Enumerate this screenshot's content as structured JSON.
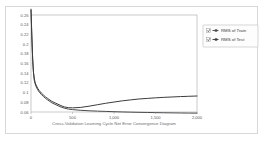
{
  "panel": {
    "background_color": "#ffffff",
    "border_color": "#d8d8d8"
  },
  "chart_data": {
    "type": "line",
    "title": "",
    "xlabel": "Cross-Validation Learning Cycle Net Error Convergence Diagram",
    "ylabel": "",
    "xlim": [
      0,
      2000
    ],
    "ylim": [
      0.06,
      0.26
    ],
    "grid": false,
    "legend_position": "right-outside",
    "x_tick_labels": [
      "0",
      "500",
      "1,000",
      "1,500",
      "2,000"
    ],
    "x_ticks": [
      0,
      500,
      1000,
      1500,
      2000
    ],
    "y_tick_labels": [
      "0.26",
      "0.24",
      "0.22",
      "0.2",
      "0.18",
      "0.16",
      "0.14",
      "0.12",
      "0.1",
      "0.08",
      "0.06"
    ],
    "y_ticks": [
      0.26,
      0.24,
      0.22,
      0.2,
      0.18,
      0.16,
      0.14,
      0.12,
      0.1,
      0.08,
      0.06
    ],
    "x": [
      0,
      10,
      20,
      30,
      40,
      50,
      60,
      80,
      100,
      125,
      150,
      175,
      200,
      250,
      300,
      350,
      400,
      450,
      500,
      600,
      700,
      800,
      900,
      1000,
      1100,
      1200,
      1300,
      1400,
      1500,
      1600,
      1700,
      1800,
      1900,
      2000
    ],
    "series": [
      {
        "name": "RMS of Train",
        "color": "#4a4a4a",
        "values": [
          0.27,
          0.215,
          0.168,
          0.14,
          0.125,
          0.118,
          0.113,
          0.106,
          0.101,
          0.096,
          0.092,
          0.088,
          0.085,
          0.079,
          0.075,
          0.071,
          0.068,
          0.066,
          0.065,
          0.0635,
          0.0625,
          0.0618,
          0.0612,
          0.0606,
          0.0601,
          0.0597,
          0.0593,
          0.059,
          0.0587,
          0.0584,
          0.0582,
          0.058,
          0.0578,
          0.0577
        ]
      },
      {
        "name": "RMS of Test",
        "color": "#3c3c3c",
        "values": [
          0.272,
          0.218,
          0.17,
          0.142,
          0.128,
          0.121,
          0.116,
          0.109,
          0.104,
          0.099,
          0.095,
          0.091,
          0.088,
          0.082,
          0.078,
          0.074,
          0.0705,
          0.069,
          0.0685,
          0.0695,
          0.072,
          0.075,
          0.078,
          0.0805,
          0.083,
          0.085,
          0.0868,
          0.088,
          0.0892,
          0.0902,
          0.091,
          0.0918,
          0.0924,
          0.093
        ]
      }
    ]
  },
  "legend": {
    "items": [
      {
        "label": "RMS of Train",
        "checked": true,
        "color": "#4a4a4a"
      },
      {
        "label": "RMS of Test",
        "checked": true,
        "color": "#3c3c3c"
      }
    ]
  }
}
